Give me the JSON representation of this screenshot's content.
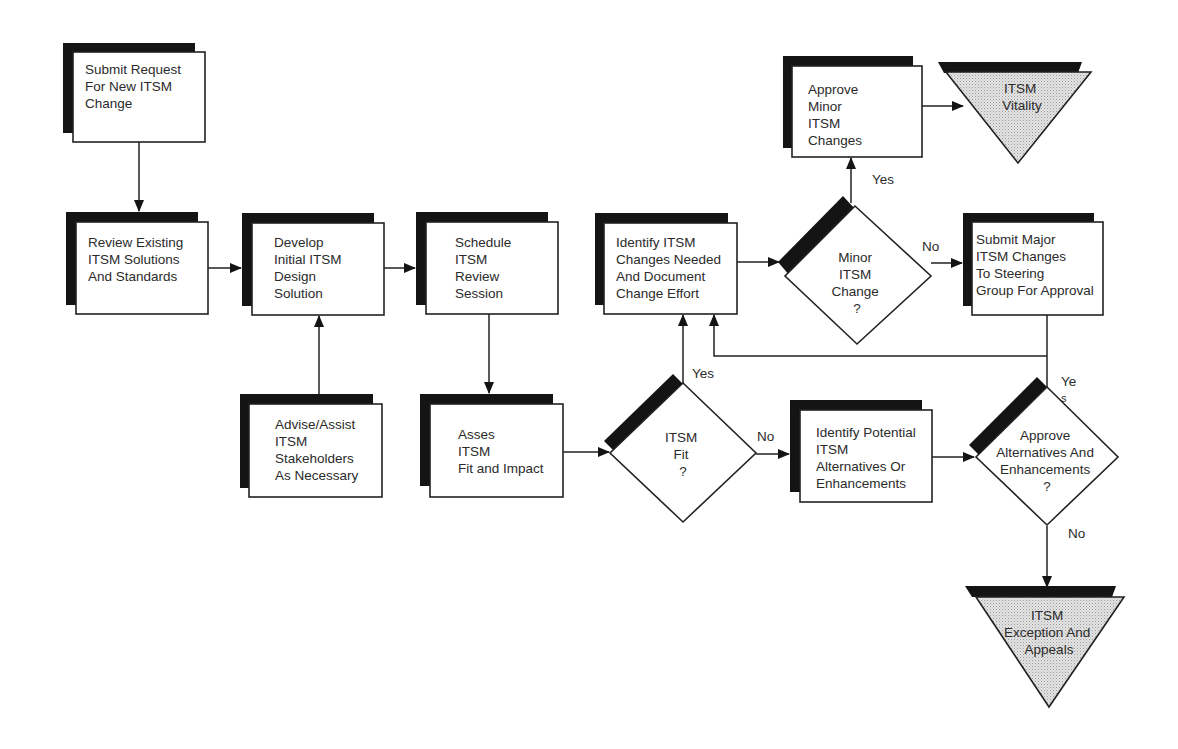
{
  "diagram": {
    "type": "flowchart",
    "colors": {
      "ink": "#222222",
      "shadow": "#141414",
      "terminal_fill": "#d9d9d9",
      "background": "#ffffff"
    },
    "nodes": {
      "submit_request": {
        "kind": "process",
        "lines": [
          "Submit Request",
          "For New ITSM",
          "Change"
        ]
      },
      "review_existing": {
        "kind": "process",
        "lines": [
          "Review Existing",
          "ITSM Solutions",
          "And Standards"
        ]
      },
      "develop_initial": {
        "kind": "process",
        "lines": [
          "Develop",
          "Initial ITSM",
          "Design",
          "Solution"
        ]
      },
      "schedule_review": {
        "kind": "process",
        "lines": [
          "Schedule",
          "ITSM",
          "Review",
          "Session"
        ]
      },
      "identify_changes": {
        "kind": "process",
        "lines": [
          "Identify ITSM",
          "Changes Needed",
          "And Document",
          "Change Effort"
        ]
      },
      "minor_change": {
        "kind": "decision",
        "lines": [
          "Minor",
          "ITSM",
          "Change",
          "?"
        ]
      },
      "approve_minor": {
        "kind": "process",
        "lines": [
          "Approve",
          "Minor",
          "ITSM",
          "Changes"
        ]
      },
      "itsm_vitality": {
        "kind": "terminal",
        "lines": [
          "ITSM",
          "Vitality"
        ]
      },
      "submit_major": {
        "kind": "process",
        "lines": [
          "Submit Major",
          "ITSM Changes",
          "To Steering",
          "Group For Approval"
        ]
      },
      "advise_assist": {
        "kind": "process",
        "lines": [
          "Advise/Assist",
          "ITSM",
          "Stakeholders",
          "As Necessary"
        ]
      },
      "asses_fit": {
        "kind": "process",
        "lines": [
          "Asses",
          "ITSM",
          "Fit and Impact"
        ]
      },
      "itsm_fit": {
        "kind": "decision",
        "lines": [
          "ITSM",
          "Fit",
          "?"
        ]
      },
      "identify_alternatives": {
        "kind": "process",
        "lines": [
          "Identify Potential",
          "ITSM",
          "Alternatives Or",
          "Enhancements"
        ]
      },
      "approve_alternatives": {
        "kind": "decision",
        "lines": [
          "Approve",
          "Alternatives And",
          "Enhancements",
          "?"
        ]
      },
      "exception_appeals": {
        "kind": "terminal",
        "lines": [
          "ITSM",
          "Exception And",
          "Appeals"
        ]
      }
    },
    "edges": [
      {
        "from": "submit_request",
        "to": "review_existing",
        "label": ""
      },
      {
        "from": "review_existing",
        "to": "develop_initial",
        "label": ""
      },
      {
        "from": "advise_assist",
        "to": "develop_initial",
        "label": ""
      },
      {
        "from": "develop_initial",
        "to": "schedule_review",
        "label": ""
      },
      {
        "from": "schedule_review",
        "to": "asses_fit",
        "label": ""
      },
      {
        "from": "asses_fit",
        "to": "itsm_fit",
        "label": ""
      },
      {
        "from": "itsm_fit",
        "to": "identify_changes",
        "label": "Yes"
      },
      {
        "from": "itsm_fit",
        "to": "identify_alternatives",
        "label": "No"
      },
      {
        "from": "identify_changes",
        "to": "minor_change",
        "label": ""
      },
      {
        "from": "minor_change",
        "to": "approve_minor",
        "label": "Yes"
      },
      {
        "from": "minor_change",
        "to": "submit_major",
        "label": "No"
      },
      {
        "from": "approve_minor",
        "to": "itsm_vitality",
        "label": ""
      },
      {
        "from": "submit_major",
        "to": "approve_alternatives",
        "label": ""
      },
      {
        "from": "identify_alternatives",
        "to": "approve_alternatives",
        "label": ""
      },
      {
        "from": "approve_alternatives",
        "to": "identify_changes",
        "label": "Ye s"
      },
      {
        "from": "approve_alternatives",
        "to": "exception_appeals",
        "label": "No"
      }
    ],
    "labels": {
      "fit_yes": "Yes",
      "fit_no": "No",
      "minor_yes": "Yes",
      "minor_no": "No",
      "alt_yes_1": "Ye",
      "alt_yes_2": "s",
      "alt_no": "No"
    }
  }
}
